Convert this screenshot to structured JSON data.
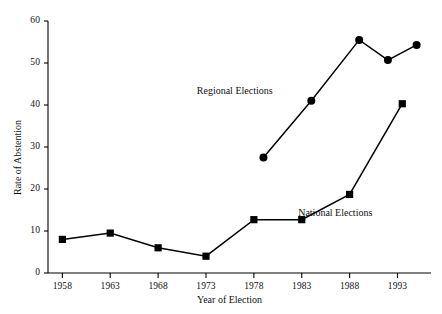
{
  "chart_data": {
    "type": "line",
    "title": "",
    "xlabel": "Year of Election",
    "ylabel": "Rate of Abstention",
    "xlim": [
      1956.5,
      1996.5
    ],
    "ylim": [
      0,
      60
    ],
    "grid": false,
    "legend_position": "inline-annotations",
    "xticks": [
      1958,
      1963,
      1968,
      1973,
      1978,
      1983,
      1988,
      1993
    ],
    "xtick_labels": [
      "1958",
      "1963",
      "1968",
      "1973",
      "1978",
      "1983",
      "1988",
      "1993"
    ],
    "yticks": [
      0,
      10,
      20,
      30,
      40,
      50,
      60
    ],
    "ytick_labels": [
      "0",
      "10",
      "20",
      "30",
      "40",
      "50",
      "60"
    ],
    "series": [
      {
        "name": "Regional Elections",
        "marker": "circle",
        "color": "#000000",
        "x": [
          1979.0,
          1984.0,
          1989.0,
          1992.0,
          1995.0
        ],
        "values": [
          27.5,
          41.0,
          55.5,
          50.7,
          54.3
        ]
      },
      {
        "name": "National Elections",
        "marker": "square",
        "color": "#000000",
        "x": [
          1958,
          1963,
          1968,
          1973,
          1978,
          1983,
          1988,
          1993.5
        ],
        "values": [
          8.0,
          9.5,
          6.0,
          4.0,
          12.7,
          12.7,
          18.7,
          40.3
        ]
      }
    ],
    "annotations": [
      {
        "text": "Regional Elections",
        "x": 1976.0,
        "y": 43.5
      },
      {
        "text": "National Elections",
        "x": 1986.5,
        "y": 14.5
      }
    ]
  }
}
